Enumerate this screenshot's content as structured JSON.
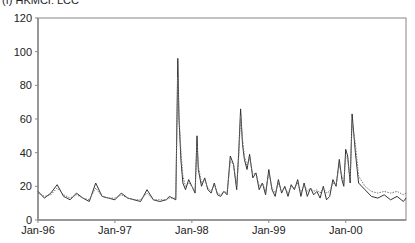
{
  "chart_data": {
    "type": "line",
    "title": "(f) HKMCI: LCC",
    "xlabel": "",
    "ylabel": "",
    "ylim": [
      0,
      120
    ],
    "yticks": [
      0,
      20,
      40,
      60,
      80,
      100,
      120
    ],
    "xtick_labels": [
      "Jan-96",
      "Jan-97",
      "Jan-98",
      "Jan-99",
      "Jan-00"
    ],
    "xtick_months": [
      0,
      12,
      24,
      36,
      48
    ],
    "xlim_months": [
      0,
      57.4
    ],
    "grid": false,
    "legend": null,
    "x_unit": "months since Jan-96",
    "x": [
      0,
      1,
      2,
      3,
      4,
      5,
      6,
      7,
      8,
      9,
      10,
      11,
      12,
      13,
      14,
      15,
      16,
      17,
      18,
      19,
      20,
      20.5,
      21,
      21.5,
      21.8,
      22,
      22.3,
      22.6,
      23,
      23.5,
      24,
      24.5,
      24.8,
      25,
      25.5,
      26,
      26.5,
      27,
      27.5,
      28,
      28.5,
      29,
      29.5,
      30,
      30.5,
      31,
      31.3,
      31.6,
      31.9,
      32.2,
      32.6,
      33,
      33.5,
      34,
      34.5,
      35,
      35.5,
      36,
      36.5,
      37,
      37.5,
      38,
      38.5,
      39,
      39.5,
      40,
      40.5,
      41,
      41.5,
      42,
      42.5,
      43,
      43.5,
      44,
      44.5,
      45,
      45.5,
      46,
      46.5,
      47,
      47.4,
      47.7,
      48,
      48.3,
      48.7,
      49,
      49.5,
      50,
      51,
      52,
      53,
      54,
      55,
      56,
      57,
      57.4
    ],
    "series": [
      {
        "name": "Actual (solid)",
        "style": "solid",
        "values": [
          17,
          13,
          16,
          21,
          14,
          12,
          16,
          13,
          11,
          22,
          14,
          13,
          12,
          16,
          13,
          12,
          11,
          18,
          12,
          11,
          12,
          14,
          13,
          12,
          96,
          60,
          35,
          22,
          18,
          24,
          20,
          16,
          50,
          30,
          20,
          25,
          18,
          16,
          22,
          15,
          14,
          17,
          15,
          38,
          33,
          18,
          40,
          66,
          45,
          36,
          30,
          39,
          25,
          28,
          18,
          22,
          15,
          30,
          18,
          14,
          24,
          16,
          20,
          14,
          21,
          18,
          24,
          14,
          22,
          14,
          19,
          15,
          17,
          13,
          20,
          12,
          14,
          24,
          20,
          36,
          24,
          20,
          42,
          38,
          22,
          63,
          40,
          22,
          18,
          14,
          13,
          15,
          12,
          14,
          11,
          13
        ]
      },
      {
        "name": "Fitted (dotted)",
        "style": "dotted",
        "values": [
          16,
          14,
          15,
          19,
          15,
          13,
          15,
          13,
          12,
          19,
          14,
          13,
          13,
          15,
          13,
          12,
          12,
          16,
          12,
          12,
          12,
          13,
          13,
          13,
          85,
          62,
          40,
          26,
          20,
          22,
          20,
          17,
          44,
          32,
          22,
          24,
          19,
          17,
          21,
          16,
          15,
          17,
          16,
          35,
          33,
          20,
          37,
          62,
          48,
          38,
          32,
          37,
          27,
          28,
          20,
          22,
          17,
          28,
          19,
          16,
          22,
          17,
          19,
          16,
          20,
          19,
          22,
          16,
          21,
          17,
          19,
          17,
          18,
          16,
          19,
          16,
          17,
          22,
          21,
          33,
          26,
          22,
          38,
          36,
          24,
          58,
          45,
          26,
          20,
          17,
          16,
          17,
          16,
          17,
          15,
          16
        ]
      }
    ]
  }
}
